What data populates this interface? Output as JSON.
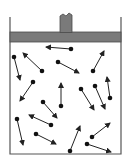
{
  "diagram": {
    "title": "",
    "colors": {
      "background": "#ffffff",
      "wall": "#555555",
      "piston": "#7a7a7a",
      "piston_edge": "#4a4a4a",
      "particle": "#111111",
      "arrow": "#222222"
    },
    "container": {
      "left": 10,
      "right": 121,
      "top": 17,
      "bottom": 154
    },
    "piston": {
      "plate_top": 32,
      "plate_bottom": 42,
      "stem_left": 60,
      "stem_right": 72,
      "stem_top": 14
    },
    "particles": [
      {
        "x": 71,
        "y": 49,
        "tx": 46,
        "ty": 47
      },
      {
        "x": 14,
        "y": 57,
        "tx": 20,
        "ty": 80
      },
      {
        "x": 42,
        "y": 71,
        "tx": 23,
        "ty": 53
      },
      {
        "x": 58,
        "y": 62,
        "tx": 79,
        "ty": 73
      },
      {
        "x": 93,
        "y": 71,
        "tx": 104,
        "ty": 51
      },
      {
        "x": 33,
        "y": 82,
        "tx": 20,
        "ty": 101
      },
      {
        "x": 61,
        "y": 106,
        "tx": 61,
        "ty": 83
      },
      {
        "x": 43,
        "y": 102,
        "tx": 57,
        "ty": 118
      },
      {
        "x": 81,
        "y": 89,
        "tx": 94,
        "ty": 110
      },
      {
        "x": 95,
        "y": 86,
        "tx": 105,
        "ty": 109
      },
      {
        "x": 110,
        "y": 98,
        "tx": 107,
        "ty": 77
      },
      {
        "x": 17,
        "y": 119,
        "tx": 23,
        "ty": 145
      },
      {
        "x": 51,
        "y": 125,
        "tx": 29,
        "ty": 115
      },
      {
        "x": 36,
        "y": 134,
        "tx": 56,
        "ty": 144
      },
      {
        "x": 70,
        "y": 151,
        "tx": 80,
        "ty": 126
      },
      {
        "x": 92,
        "y": 137,
        "tx": 110,
        "ty": 123
      },
      {
        "x": 87,
        "y": 144,
        "tx": 111,
        "ty": 152
      }
    ]
  }
}
